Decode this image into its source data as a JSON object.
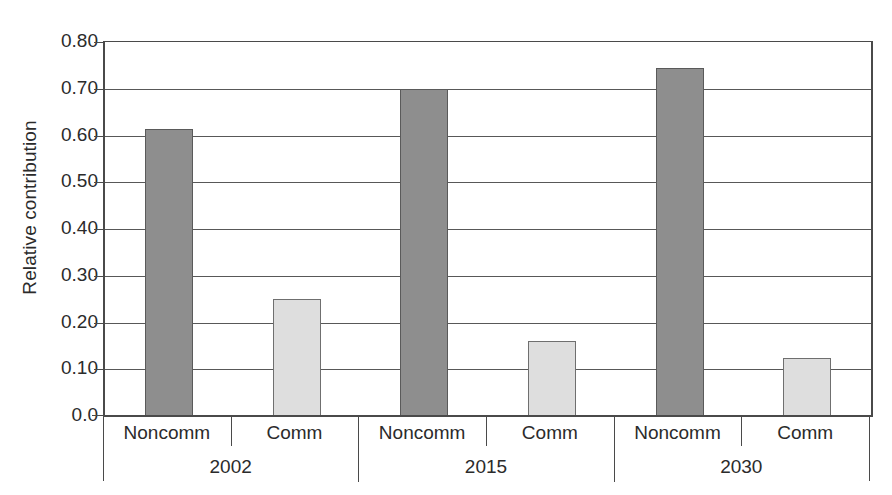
{
  "chart_data": {
    "type": "bar",
    "title": "",
    "xlabel": "",
    "ylabel": "Relative contribution",
    "ylim": [
      0.0,
      0.8
    ],
    "grid": true,
    "legend": "none",
    "categories": [
      "2002",
      "2015",
      "2030"
    ],
    "subcategories": [
      "Noncomm",
      "Comm"
    ],
    "series": [
      {
        "name": "Noncomm",
        "color": "#8e8e8e",
        "values": [
          0.615,
          0.7,
          0.745
        ]
      },
      {
        "name": "Comm",
        "color": "#dedede",
        "values": [
          0.25,
          0.16,
          0.125
        ]
      }
    ],
    "bars": [
      {
        "group": "2002",
        "sub": "Noncomm",
        "value": 0.615,
        "style": "noncomm"
      },
      {
        "group": "2002",
        "sub": "Comm",
        "value": 0.25,
        "style": "comm"
      },
      {
        "group": "2015",
        "sub": "Noncomm",
        "value": 0.7,
        "style": "noncomm"
      },
      {
        "group": "2015",
        "sub": "Comm",
        "value": 0.16,
        "style": "comm"
      },
      {
        "group": "2030",
        "sub": "Noncomm",
        "value": 0.745,
        "style": "noncomm"
      },
      {
        "group": "2030",
        "sub": "Comm",
        "value": 0.125,
        "style": "comm"
      }
    ],
    "yticks": [
      {
        "value": 0.8,
        "label": "0.80"
      },
      {
        "value": 0.7,
        "label": "0.70"
      },
      {
        "value": 0.6,
        "label": "0.60"
      },
      {
        "value": 0.5,
        "label": "0.50"
      },
      {
        "value": 0.4,
        "label": "0.40"
      },
      {
        "value": 0.3,
        "label": "0.30"
      },
      {
        "value": 0.2,
        "label": "0.20"
      },
      {
        "value": 0.1,
        "label": "0.10"
      },
      {
        "value": 0.0,
        "label": "0.0"
      }
    ]
  },
  "axis": {
    "y_title": "Relative contribution",
    "tier1_labels": [
      "Noncomm",
      "Comm",
      "Noncomm",
      "Comm",
      "Noncomm",
      "Comm"
    ],
    "tier2_labels": [
      "2002",
      "2015",
      "2030"
    ]
  },
  "colors": {
    "noncomm_fill": "#8e8e8e",
    "comm_fill": "#dedede",
    "axis_line": "#4a4a4a",
    "gridline": "#585858",
    "text": "#2b2b2b",
    "background": "#ffffff"
  }
}
